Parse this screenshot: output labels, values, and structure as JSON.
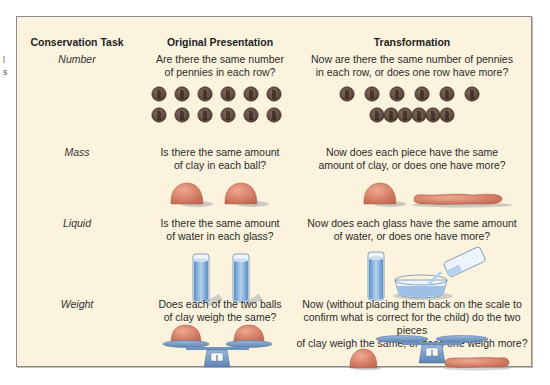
{
  "caption_fragment": [
    "l",
    "s"
  ],
  "headers": {
    "task": "Conservation Task",
    "original": "Original Presentation",
    "transformation": "Transformation"
  },
  "rows": [
    {
      "task": "Number",
      "original_q": [
        "Are there the same number",
        "of pennies in each row?"
      ],
      "transform_q": [
        "Now are there the same number of pennies",
        "in each row, or does one row have more?"
      ],
      "original_art": "two-rows-of-six-pennies-aligned",
      "transform_art": "top-row-spread-bottom-row-bunched"
    },
    {
      "task": "Mass",
      "original_q": [
        "Is there the same amount",
        "of clay in each ball?"
      ],
      "transform_q": [
        "Now does each piece have the same",
        "amount of clay, or does one have more?"
      ],
      "original_art": "two-clay-balls",
      "transform_art": "clay-ball-and-clay-sausage"
    },
    {
      "task": "Liquid",
      "original_q": [
        "Is there the same amount",
        "of water in each glass?"
      ],
      "transform_q": [
        "Now does each glass have the same amount",
        "of water, or does one have more?"
      ],
      "original_art": "two-equal-glasses-of-water",
      "transform_art": "glass-poured-into-wide-bowl"
    },
    {
      "task": "Weight",
      "original_q": [
        "Does each of the two balls",
        "of clay weigh the same?"
      ],
      "transform_q": [
        "Now (without placing them back on the scale to",
        "confirm what is correct for the child) do the two pieces",
        "of clay weigh the same, or does one weigh more?"
      ],
      "original_art": "balance-scale-with-two-clay-balls",
      "transform_art": "empty-scale-with-ball-and-sausage-beside"
    }
  ],
  "colors": {
    "panel_bg": "#fbf3dd",
    "penny": "#6b5448",
    "clay": "#d98a72",
    "water": "#8fb4dc",
    "scale": "#6f93bf"
  }
}
